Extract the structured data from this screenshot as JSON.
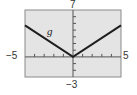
{
  "chart_data": {
    "type": "line",
    "title": "",
    "xlabel": "",
    "ylabel": "",
    "xlim": [
      -5,
      5
    ],
    "ylim": [
      -3,
      7
    ],
    "grid": false,
    "ticks": {
      "x_step": 1,
      "y_step": 1
    },
    "tick_labels": {
      "xmin": "−5",
      "xmax": "5",
      "ymin": "−3",
      "ymax": "7"
    },
    "series": [
      {
        "name": "g",
        "label": "g",
        "x": [
          -5,
          0,
          5
        ],
        "y": [
          4.7,
          0,
          4.7
        ]
      }
    ],
    "colors": {
      "background": "#e4e4e4",
      "frame": "#8a8a8a",
      "axis": "#555555",
      "line": "#1e1e1e"
    }
  }
}
